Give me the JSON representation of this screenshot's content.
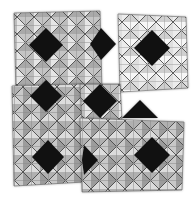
{
  "image": {
    "description": "Photograph of four overlapping square tiles printed with a grayscale geometric pattern of diagonal grids, gray-shaded triangles, and black diamonds",
    "background_color": "#ffffff",
    "line_color": "#3a3a3a",
    "palette": {
      "black": "#111111",
      "dark_gray": "#8a8a8a",
      "mid_gray": "#b4b4b4",
      "light_gray": "#d6d6d6",
      "white": "#f4f4f4"
    }
  },
  "tiles": [
    {
      "name": "top-left",
      "x": 14,
      "y": 12,
      "w": 90,
      "h": 80,
      "diamonds": [
        [
          46,
          44
        ],
        [
          110,
          44
        ]
      ]
    },
    {
      "name": "top-right",
      "x": 100,
      "y": 14,
      "w": 85,
      "h": 78,
      "diamonds": [
        [
          150,
          47
        ]
      ]
    },
    {
      "name": "bottom-left",
      "x": 10,
      "y": 86,
      "w": 82,
      "h": 92,
      "diamonds": [
        [
          46,
          92
        ],
        [
          46,
          150
        ]
      ]
    },
    {
      "name": "bottom-right",
      "x": 80,
      "y": 120,
      "w": 100,
      "h": 70,
      "diamonds": [
        [
          100,
          100
        ],
        [
          152,
          155
        ],
        [
          98,
          160
        ]
      ]
    }
  ]
}
